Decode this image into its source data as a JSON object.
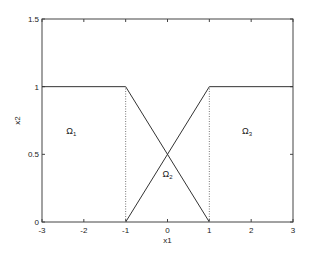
{
  "chart_data": {
    "type": "line",
    "title": "",
    "xlabel": "x1",
    "ylabel": "x2",
    "xlim": [
      -3,
      3
    ],
    "ylim": [
      0,
      1.5
    ],
    "xticks": [
      -3,
      -2,
      -1,
      0,
      1,
      2,
      3
    ],
    "yticks": [
      0,
      0.5,
      1,
      1.5
    ],
    "xtick_labels": [
      "-3",
      "-2",
      "-1",
      "0",
      "1",
      "2",
      "3"
    ],
    "ytick_labels": [
      "0",
      "0.5",
      "1",
      "1.5"
    ],
    "grid": false,
    "series": [
      {
        "name": "left-membership",
        "style": "solid",
        "x": [
          -3,
          -1,
          1
        ],
        "y": [
          1,
          1,
          0
        ]
      },
      {
        "name": "right-membership",
        "style": "solid",
        "x": [
          -1,
          1,
          3
        ],
        "y": [
          0,
          1,
          1
        ]
      },
      {
        "name": "boundary-left",
        "style": "dotted",
        "x": [
          -1,
          -1
        ],
        "y": [
          0,
          1
        ]
      },
      {
        "name": "boundary-right",
        "style": "dotted",
        "x": [
          1,
          1
        ],
        "y": [
          0,
          1
        ]
      }
    ],
    "annotations": [
      {
        "label": "Ω",
        "sub": "1",
        "x": -2.3,
        "y": 0.65
      },
      {
        "label": "Ω",
        "sub": "2",
        "x": 0,
        "y": 0.33
      },
      {
        "label": "Ω",
        "sub": "3",
        "x": 1.9,
        "y": 0.65
      }
    ]
  }
}
